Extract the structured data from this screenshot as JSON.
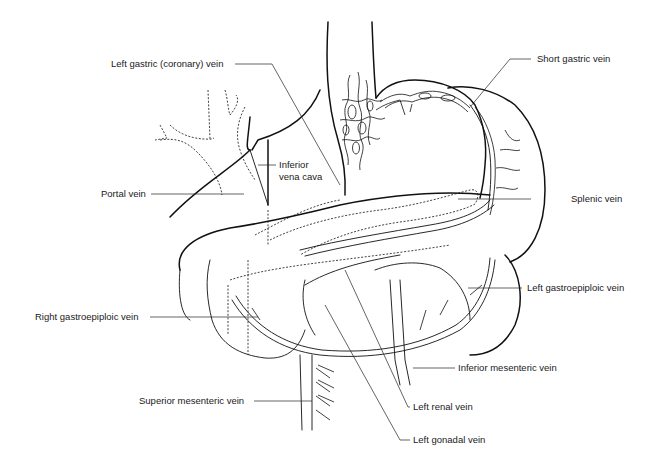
{
  "figure": {
    "line_color": "#111111",
    "background": "#ffffff"
  },
  "labels": {
    "left_gastric_vein": "Left gastric (coronary) vein",
    "short_gastric_vein": "Short gastric vein",
    "inferior_vena_cava_line1": "Inferior",
    "inferior_vena_cava_line2": "vena cava",
    "portal_vein": "Portal vein",
    "splenic_vein": "Splenic vein",
    "left_gastroepiploic_vein": "Left gastroepiploic vein",
    "right_gastroepiploic_vein": "Right gastroepiploic vein",
    "inferior_mesenteric_vein": "Inferior mesenteric vein",
    "superior_mesenteric_vein": "Superior mesenteric vein",
    "left_renal_vein": "Left renal vein",
    "left_gonadal_vein": "Left gonadal vein"
  }
}
